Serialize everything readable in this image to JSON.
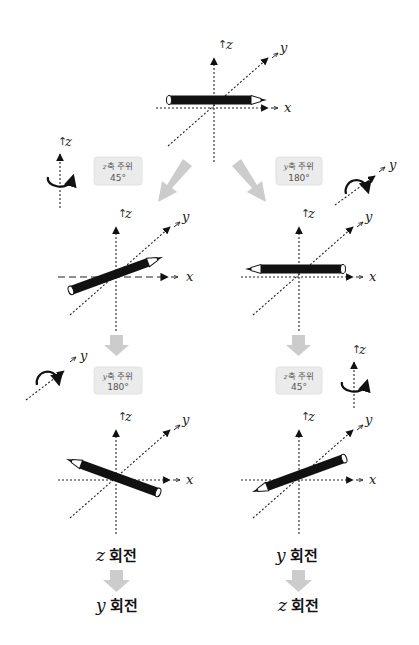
{
  "axes": {
    "x": "x",
    "y": "y",
    "z": "z"
  },
  "steps": {
    "left_first": {
      "axis_var": "z",
      "text": "축 주위",
      "angle": "45°"
    },
    "right_first": {
      "axis_var": "y",
      "text": "축 주위",
      "angle": "180°"
    },
    "left_second": {
      "axis_var": "y",
      "text": "축 주위",
      "angle": "180°"
    },
    "right_second": {
      "axis_var": "z",
      "text": "축 주위",
      "angle": "45°"
    }
  },
  "captions": {
    "left": {
      "first_var": "z",
      "first_text": "회전",
      "second_var": "y",
      "second_text": "회전"
    },
    "right": {
      "first_var": "y",
      "first_text": "회전",
      "second_var": "z",
      "second_text": "회전"
    }
  },
  "colors": {
    "arrow": "#cccccc",
    "pencil": "#111111",
    "box": "#ebebeb"
  }
}
